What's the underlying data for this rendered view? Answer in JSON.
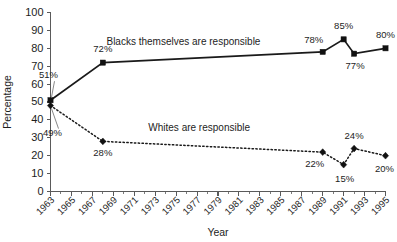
{
  "chart_data": {
    "type": "line",
    "title": "",
    "xlabel": "Year",
    "ylabel": "Percentage",
    "ylim": [
      0,
      100
    ],
    "ytick_step": 10,
    "xlim": [
      1963,
      1995
    ],
    "grid": false,
    "legend_position": "inline-annotation",
    "yticks": [
      "0",
      "10",
      "20",
      "30",
      "40",
      "50",
      "60",
      "70",
      "80",
      "90",
      "100"
    ],
    "xticks": [
      "1963",
      "1965",
      "1967",
      "1969",
      "1971",
      "1973",
      "1975",
      "1977",
      "1979",
      "1981",
      "1983",
      "1985",
      "1987",
      "1989",
      "1991",
      "1993",
      "1995"
    ],
    "series": [
      {
        "name": "Blacks themselves are responsible",
        "style": "solid",
        "marker": "square",
        "label": "Blacks themselves are responsible",
        "label_x": 1975.7,
        "label_y": 82,
        "points": [
          {
            "x": 1963,
            "y": 51,
            "label": "51%",
            "label_dx": -2,
            "label_dy": -22,
            "leader": true
          },
          {
            "x": 1968,
            "y": 72,
            "label": "72%",
            "label_dx": 0,
            "label_dy": -11,
            "leader": false
          },
          {
            "x": 1989,
            "y": 78,
            "label": "78%",
            "label_dx": -9,
            "label_dy": -9,
            "leader": false
          },
          {
            "x": 1991,
            "y": 85,
            "label": "85%",
            "label_dx": 0,
            "label_dy": -10,
            "leader": false
          },
          {
            "x": 1992,
            "y": 77,
            "label": "77%",
            "label_dx": 1,
            "label_dy": 15,
            "leader": false
          },
          {
            "x": 1995,
            "y": 80,
            "label": "80%",
            "label_dx": 0,
            "label_dy": -10,
            "leader": false
          }
        ]
      },
      {
        "name": "Whites are responsible",
        "style": "dotted",
        "marker": "diamond",
        "label": "Whites are responsible",
        "label_x": 1977.2,
        "label_y": 34,
        "points": [
          {
            "x": 1963,
            "y": 48,
            "label": "49%",
            "label_dx": 2,
            "label_dy": 30,
            "leader": true
          },
          {
            "x": 1968,
            "y": 28,
            "label": "28%",
            "label_dx": 0,
            "label_dy": 15,
            "leader": false
          },
          {
            "x": 1989,
            "y": 22,
            "label": "22%",
            "label_dx": -8,
            "label_dy": 15,
            "leader": false
          },
          {
            "x": 1991,
            "y": 15,
            "label": "15%",
            "label_dx": 1,
            "label_dy": 17,
            "leader": false
          },
          {
            "x": 1992,
            "y": 24,
            "label": "24%",
            "label_dx": 0,
            "label_dy": -10,
            "leader": false
          },
          {
            "x": 1995,
            "y": 20,
            "label": "20%",
            "label_dx": -1,
            "label_dy": 16,
            "leader": false
          }
        ]
      }
    ],
    "colors": {
      "series_line": "#111111",
      "axis": "#5a5a5a",
      "text": "#1d1d1d",
      "background": "#ffffff"
    }
  }
}
